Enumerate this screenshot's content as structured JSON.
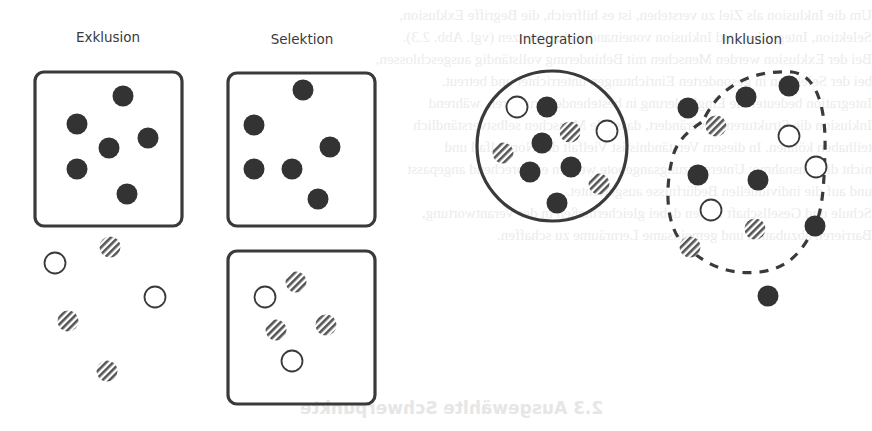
{
  "colors": {
    "stroke": "#3a3a3a",
    "filled_dot": "#333333",
    "hatch": "#555555",
    "background": "#ffffff"
  },
  "panels": [
    {
      "id": "exklusion",
      "title": "Exklusion"
    },
    {
      "id": "selektion",
      "title": "Selektion"
    },
    {
      "id": "integration",
      "title": "Integration"
    },
    {
      "id": "inklusion",
      "title": "Inklusion"
    }
  ],
  "legend_semantics": {
    "filled_dot": "majority group",
    "hollow_dot": "minority group A",
    "hatched_dot": "minority group B"
  },
  "shapes": {
    "exklusion": {
      "box": {
        "x": 35,
        "y": 72,
        "w": 147,
        "h": 154,
        "r": 9
      },
      "filled": [
        [
          123,
          96
        ],
        [
          77,
          124
        ],
        [
          148,
          138
        ],
        [
          109,
          148
        ],
        [
          77,
          169
        ],
        [
          127,
          194
        ]
      ],
      "hollow_outside": [
        [
          55,
          263
        ],
        [
          155,
          297
        ]
      ],
      "hatched_outside": [
        [
          110,
          247
        ],
        [
          68,
          321
        ],
        [
          107,
          371
        ]
      ]
    },
    "selektion": {
      "box_top": {
        "x": 228,
        "y": 73,
        "w": 147,
        "h": 153,
        "r": 9
      },
      "filled": [
        [
          303,
          90
        ],
        [
          254,
          125
        ],
        [
          330,
          147
        ],
        [
          254,
          169
        ],
        [
          292,
          169
        ],
        [
          318,
          199
        ]
      ],
      "box_bottom": {
        "x": 228,
        "y": 251,
        "w": 147,
        "h": 153,
        "r": 9
      },
      "hollow": [
        [
          265,
          297
        ],
        [
          292,
          361
        ]
      ],
      "hatched": [
        [
          296,
          282
        ],
        [
          276,
          330
        ],
        [
          326,
          325
        ]
      ]
    },
    "integration": {
      "circle": {
        "cx": 552,
        "cy": 146,
        "r": 75
      },
      "filled": [
        [
          547,
          107
        ],
        [
          542,
          143
        ],
        [
          530,
          172
        ],
        [
          571,
          167
        ],
        [
          557,
          203
        ]
      ],
      "hollow": [
        [
          517,
          107
        ],
        [
          607,
          131
        ]
      ],
      "hatched": [
        [
          570,
          132
        ],
        [
          503,
          153
        ],
        [
          599,
          184
        ]
      ]
    },
    "inklusion": {
      "filled": [
        [
          688,
          108
        ],
        [
          746,
          97
        ],
        [
          789,
          86
        ],
        [
          698,
          175
        ],
        [
          758,
          180
        ],
        [
          815,
          226
        ],
        [
          768,
          296
        ]
      ],
      "hollow": [
        [
          789,
          136
        ],
        [
          816,
          167
        ],
        [
          711,
          210
        ]
      ],
      "hatched": [
        [
          716,
          126
        ],
        [
          755,
          229
        ],
        [
          690,
          247
        ]
      ]
    }
  },
  "bleed_through": {
    "lines": [
      "Um die Inklusion als Ziel zu verstehen, ist es hilfreich, die Begriffe Exklusion,",
      "Selektion, Integration und Inklusion voneinander abzugrenzen (vgl. Abb. 2.3).",
      "Bei der Exklusion werden Menschen mit Behinderung vollständig ausgeschlossen,",
      "bei der Selektion in gesonderten Einrichtungen unterrichtet und betreut.",
      "Integration bedeutet die Eingliederung in bestehende Strukturen, während",
      "Inklusion die Strukturen so verändert, dass alle Menschen selbstverständlich",
      "teilhaben können. In diesem Verständnis ist Vielfalt der Normalfall und",
      "nicht die Ausnahme; Unterstützungsangebote werden entsprechend angepasst",
      "und auf die individuellen Bedürfnisse ausgerichtet.",
      "Schule und Gesellschaft stehen dabei gleichermaßen in der Verantwortung,",
      "Barrieren abzubauen und gemeinsame Lernräume zu schaffen."
    ],
    "heading": "2.3   Ausgewählte Schwerpunkte"
  }
}
